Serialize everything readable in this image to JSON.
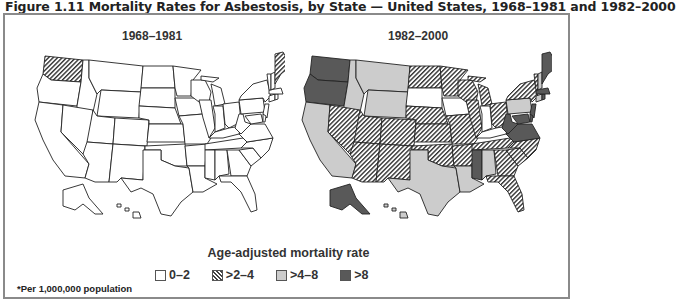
{
  "figure": {
    "title": "Figure 1.11 Mortality Rates for Asbestosis, by State — United States, 1968–1981 and 1982–2000",
    "footnote": "*Per 1,000,000 population"
  },
  "legend": {
    "title": "Age-adjusted mortality rate",
    "items": [
      {
        "label": "0–2",
        "category": "c0",
        "color": "#ffffff",
        "pattern": "none"
      },
      {
        "label": ">2–4",
        "category": "c1",
        "color": "#ffffff",
        "pattern": "diagonal-hatch"
      },
      {
        "label": ">4–8",
        "category": "c2",
        "color": "#cccccc",
        "pattern": "none"
      },
      {
        "label": ">8",
        "category": "c3",
        "color": "#595959",
        "pattern": "none"
      }
    ]
  },
  "maps": [
    {
      "title": "1968–1981",
      "states": {
        "WA": "c1",
        "ME": "c1",
        "OR": "c0",
        "CA": "c0",
        "ID": "c0",
        "NV": "c0",
        "MT": "c0",
        "WY": "c0",
        "UT": "c0",
        "AZ": "c0",
        "CO": "c0",
        "NM": "c0",
        "ND": "c0",
        "SD": "c0",
        "NE": "c0",
        "KS": "c0",
        "OK": "c0",
        "TX": "c0",
        "MN": "c0",
        "IA": "c0",
        "MO": "c0",
        "AR": "c0",
        "LA": "c0",
        "WI": "c0",
        "IL": "c0",
        "MI": "c0",
        "IN": "c0",
        "OH": "c0",
        "KY": "c0",
        "TN": "c0",
        "MS": "c0",
        "AL": "c0",
        "GA": "c0",
        "FL": "c0",
        "SC": "c0",
        "NC": "c0",
        "VA": "c0",
        "WV": "c0",
        "PA": "c0",
        "NY": "c0",
        "NJ": "c0",
        "MD": "c0",
        "DE": "c0",
        "CT": "c0",
        "RI": "c0",
        "MA": "c0",
        "VT": "c0",
        "NH": "c0",
        "AK": "c0",
        "HI": "c0"
      }
    },
    {
      "title": "1982–2000",
      "states": {
        "WA": "c3",
        "OR": "c3",
        "AK": "c3",
        "MS": "c3",
        "WV": "c3",
        "VA": "c3",
        "ME": "c3",
        "MD": "c3",
        "NJ": "c3",
        "DE": "c3",
        "RI": "c3",
        "MA": "c3",
        "CA": "c2",
        "ID": "c2",
        "MT": "c2",
        "WY": "c2",
        "TX": "c2",
        "LA": "c2",
        "AL": "c2",
        "PA": "c2",
        "HI": "c2",
        "NH": "c2",
        "CT": "c2",
        "NV": "c1",
        "UT": "c1",
        "AZ": "c1",
        "CO": "c1",
        "NM": "c1",
        "ND": "c1",
        "NE": "c1",
        "KS": "c1",
        "OK": "c1",
        "MN": "c1",
        "MO": "c1",
        "AR": "c1",
        "WI": "c1",
        "IL": "c1",
        "MI": "c1",
        "OH": "c1",
        "TN": "c1",
        "GA": "c1",
        "FL": "c1",
        "SC": "c1",
        "NC": "c1",
        "NY": "c1",
        "VT": "c1",
        "SD": "c0",
        "IA": "c0",
        "IN": "c0",
        "KY": "c0"
      }
    }
  ]
}
